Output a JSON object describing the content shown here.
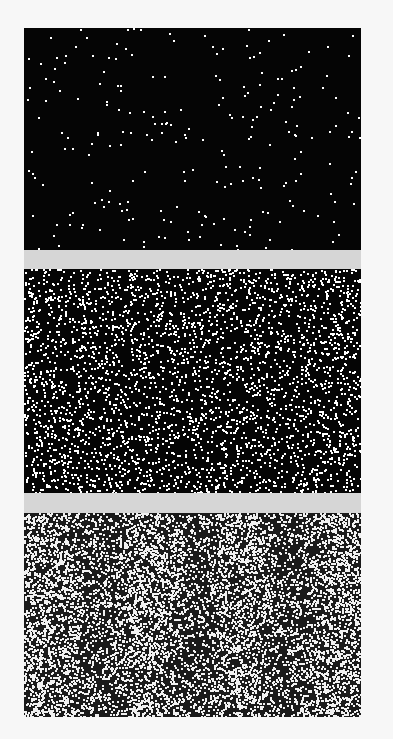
{
  "figure": {
    "background": "#f7f7f7",
    "gap_color": "#d6d6d6",
    "panels": [
      {
        "id": "sparse",
        "top": 0,
        "height": 222,
        "dot_count": 230,
        "dot_size": 2,
        "dot_color": "#ffffff",
        "background": "#050505",
        "banding": 0
      },
      {
        "id": "medium",
        "top": 241,
        "height": 224,
        "dot_count": 3200,
        "dot_size": 2,
        "dot_color": "#ffffff",
        "background": "#050505",
        "banding": 0
      },
      {
        "id": "dense",
        "top": 485,
        "height": 204,
        "dot_count": 11000,
        "dot_size": 2,
        "dot_color": "#f0f0f0",
        "background": "#1a1a1a",
        "banding": 0.45
      }
    ],
    "gaps": [
      {
        "top": 222,
        "height": 19
      },
      {
        "top": 465,
        "height": 20
      }
    ]
  }
}
